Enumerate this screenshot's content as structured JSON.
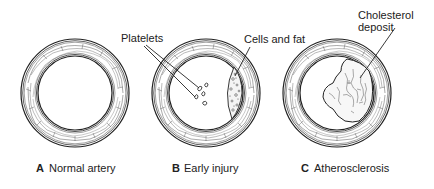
{
  "diagram": {
    "panels": [
      {
        "letter": "A",
        "caption": "Normal artery",
        "center": [
          75,
          93
        ],
        "outer_radius": 54,
        "inner_radius": 37
      },
      {
        "letter": "B",
        "caption": "Early injury",
        "center": [
          206,
          93
        ],
        "outer_radius": 54,
        "inner_radius": 37
      },
      {
        "letter": "C",
        "caption": "Atherosclerosis",
        "center": [
          337,
          93
        ],
        "outer_radius": 54,
        "inner_radius": 37
      }
    ],
    "callouts": {
      "platelets": "Platelets",
      "cells_and_fat": "Cells and fat",
      "cholesterol_line1": "Cholesterol",
      "cholesterol_line2": "deposit"
    },
    "colors": {
      "ink": "#222222",
      "background": "#ffffff"
    }
  }
}
